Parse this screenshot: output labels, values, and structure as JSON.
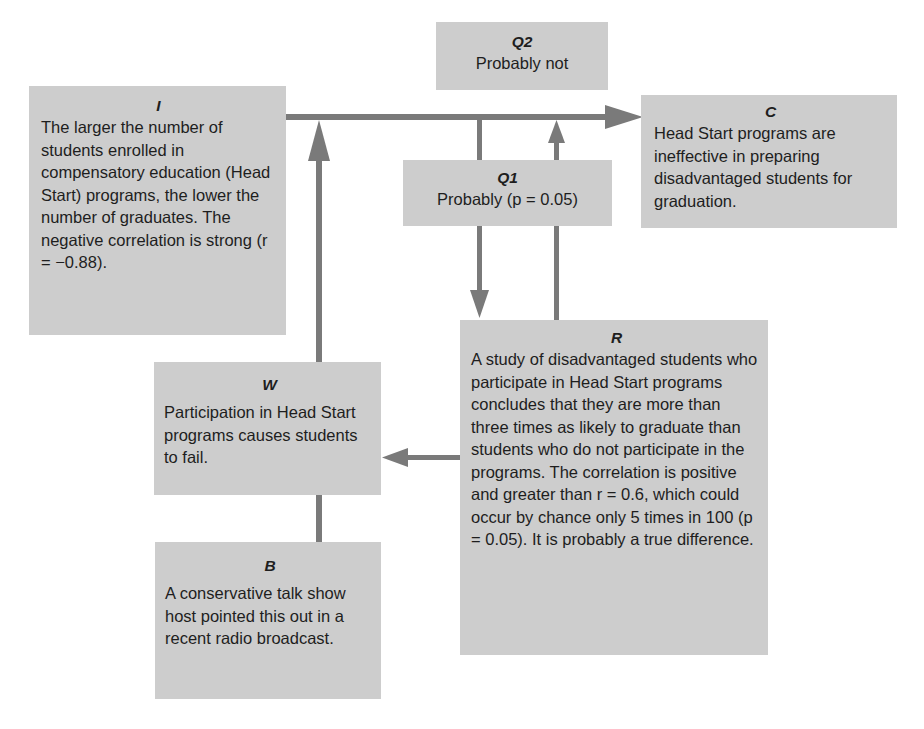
{
  "colors": {
    "box_fill": "#cdcdcd",
    "arrow": "#7a7a7a",
    "text": "#1e1e1e",
    "background": "#ffffff"
  },
  "nodes": {
    "I": {
      "label": "I",
      "text": "The larger the number of students enrolled in compensatory education (Head Start) programs, the lower the number of graduates. The negative correlation is strong (r = −0.88)."
    },
    "Q2": {
      "label": "Q2",
      "text": "Probably not"
    },
    "C": {
      "label": "C",
      "text": "Head Start programs are ineffective in preparing disadvantaged students for graduation."
    },
    "Q1": {
      "label": "Q1",
      "text": "Probably (p = 0.05)"
    },
    "R": {
      "label": "R",
      "text": "A study of disadvantaged students who participate in Head Start programs concludes that they are more than three times as likely to graduate than students who do not participate in the programs. The correlation is positive and greater than r = 0.6, which could occur by chance only 5 times in 100 (p = 0.05). It is probably a true difference."
    },
    "W": {
      "label": "W",
      "text": "Participation in Head Start programs causes students to fail."
    },
    "B": {
      "label": "B",
      "text": "A conservative talk show host pointed this out in a recent radio broadcast."
    }
  },
  "edges": [
    {
      "from": "I",
      "to": "C",
      "type": "arrow"
    },
    {
      "from": "W",
      "to": "I-C line",
      "type": "arrow"
    },
    {
      "from": "B",
      "to": "W",
      "type": "line"
    },
    {
      "from": "I-C line",
      "to": "Q1",
      "type": "line"
    },
    {
      "from": "Q1",
      "to": "R",
      "type": "arrow"
    },
    {
      "from": "R",
      "to": "I-C line",
      "type": "arrow"
    },
    {
      "from": "R",
      "to": "W",
      "type": "arrow"
    }
  ]
}
